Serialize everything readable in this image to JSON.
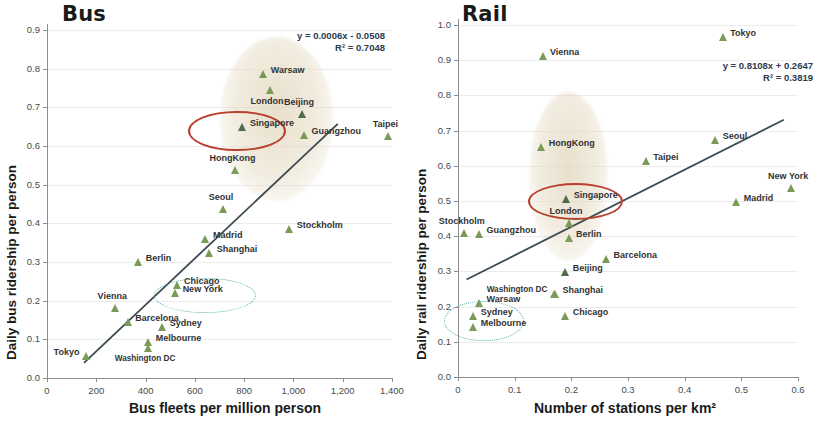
{
  "chart_data": [
    {
      "type": "scatter",
      "title": "Bus",
      "xlabel": "Bus fleets per million person",
      "ylabel": "Daily bus ridership per person",
      "xlim": [
        0,
        1400
      ],
      "ylim": [
        0,
        0.9
      ],
      "xticks": [
        "0",
        "200",
        "400",
        "600",
        "800",
        "1,000",
        "1,200",
        "1,400"
      ],
      "xtick_values": [
        0,
        200,
        400,
        600,
        800,
        1000,
        1200,
        1400
      ],
      "yticks": [
        "0.0",
        "0.1",
        "0.2",
        "0.3",
        "0.4",
        "0.5",
        "0.6",
        "0.7",
        "0.8",
        "0.9"
      ],
      "ytick_values": [
        0.0,
        0.1,
        0.2,
        0.3,
        0.4,
        0.5,
        0.6,
        0.7,
        0.8,
        0.9
      ],
      "grid": true,
      "legend": "none",
      "equation": "y = 0.0006x - 0.0508",
      "r2": "R² = 0.7048",
      "trendline": {
        "slope": 0.0006,
        "intercept": -0.0508,
        "x_start": 150,
        "x_end": 1180
      },
      "points": [
        {
          "label": "Warsaw",
          "x": 880,
          "y": 0.785,
          "label_pos": "right"
        },
        {
          "label": "London",
          "x": 905,
          "y": 0.745,
          "label_pos": "below"
        },
        {
          "label": "Beijing",
          "x": 1035,
          "y": 0.682,
          "label_pos": "above"
        },
        {
          "label": "Singapore",
          "x": 795,
          "y": 0.65,
          "label_pos": "right",
          "highlight": "red"
        },
        {
          "label": "Taipei",
          "x": 1385,
          "y": 0.627,
          "label_pos": "above"
        },
        {
          "label": "Guangzhou",
          "x": 1045,
          "y": 0.628,
          "label_pos": "right"
        },
        {
          "label": "HongKong",
          "x": 765,
          "y": 0.538,
          "label_pos": "above"
        },
        {
          "label": "Seoul",
          "x": 718,
          "y": 0.437,
          "label_pos": "above"
        },
        {
          "label": "Stockholm",
          "x": 985,
          "y": 0.385,
          "label_pos": "right"
        },
        {
          "label": "Madrid",
          "x": 645,
          "y": 0.36,
          "label_pos": "right"
        },
        {
          "label": "Shanghai",
          "x": 660,
          "y": 0.322,
          "label_pos": "right"
        },
        {
          "label": "Berlin",
          "x": 372,
          "y": 0.3,
          "label_pos": "right"
        },
        {
          "label": "Chicago",
          "x": 528,
          "y": 0.241,
          "label_pos": "right"
        },
        {
          "label": "New York",
          "x": 522,
          "y": 0.219,
          "label_pos": "right"
        },
        {
          "label": "Vienna",
          "x": 277,
          "y": 0.181,
          "label_pos": "above"
        },
        {
          "label": "Barcelona",
          "x": 330,
          "y": 0.145,
          "label_pos": "right"
        },
        {
          "label": "Sydney",
          "x": 470,
          "y": 0.133,
          "label_pos": "right",
          "highlight": "teal"
        },
        {
          "label": "Melbourne",
          "x": 413,
          "y": 0.093,
          "label_pos": "right",
          "highlight": "teal"
        },
        {
          "label": "Washington DC",
          "x": 410,
          "y": 0.078,
          "label_pos": "below"
        },
        {
          "label": "Tokyo",
          "x": 160,
          "y": 0.057,
          "label_pos": "left"
        }
      ]
    },
    {
      "type": "scatter",
      "title": "Rail",
      "xlabel": "Number of stations per km²",
      "ylabel": "Daily rail ridership per person",
      "xlim": [
        0,
        0.6
      ],
      "ylim": [
        0,
        1.0
      ],
      "xticks": [
        "0",
        "0.1",
        "0.2",
        "0.3",
        "0.4",
        "0.5",
        "0.6"
      ],
      "xtick_values": [
        0,
        0.1,
        0.2,
        0.3,
        0.4,
        0.5,
        0.6
      ],
      "yticks": [
        "0.0",
        "0.1",
        "0.2",
        "0.3",
        "0.4",
        "0.5",
        "0.6",
        "0.7",
        "0.8",
        "0.9",
        "1.0"
      ],
      "ytick_values": [
        0.0,
        0.1,
        0.2,
        0.3,
        0.4,
        0.5,
        0.6,
        0.7,
        0.8,
        0.9,
        1.0
      ],
      "grid": true,
      "legend": "none",
      "equation": "y = 0.8108x + 0.2647",
      "r2": "R² = 0.3819",
      "trendline": {
        "slope": 0.8108,
        "intercept": 0.2647,
        "x_start": 0.015,
        "x_end": 0.575
      },
      "points": [
        {
          "label": "Tokyo",
          "x": 0.468,
          "y": 0.965,
          "label_pos": "right"
        },
        {
          "label": "Vienna",
          "x": 0.15,
          "y": 0.913,
          "label_pos": "right"
        },
        {
          "label": "Seoul",
          "x": 0.455,
          "y": 0.672,
          "label_pos": "right"
        },
        {
          "label": "HongKong",
          "x": 0.148,
          "y": 0.652,
          "label_pos": "right"
        },
        {
          "label": "Taipei",
          "x": 0.332,
          "y": 0.613,
          "label_pos": "right"
        },
        {
          "label": "New York",
          "x": 0.588,
          "y": 0.538,
          "label_pos": "above"
        },
        {
          "label": "Singapore",
          "x": 0.192,
          "y": 0.505,
          "label_pos": "right",
          "highlight": "red"
        },
        {
          "label": "Madrid",
          "x": 0.492,
          "y": 0.498,
          "label_pos": "right"
        },
        {
          "label": "London",
          "x": 0.196,
          "y": 0.437,
          "label_pos": "above"
        },
        {
          "label": "Stockholm",
          "x": 0.012,
          "y": 0.408,
          "label_pos": "above"
        },
        {
          "label": "Guangzhou",
          "x": 0.038,
          "y": 0.406,
          "label_pos": "right"
        },
        {
          "label": "Berlin",
          "x": 0.196,
          "y": 0.396,
          "label_pos": "right"
        },
        {
          "label": "Barcelona",
          "x": 0.262,
          "y": 0.334,
          "label_pos": "right"
        },
        {
          "label": "Beijing",
          "x": 0.19,
          "y": 0.299,
          "label_pos": "right"
        },
        {
          "label": "Shanghai",
          "x": 0.172,
          "y": 0.237,
          "label_pos": "right"
        },
        {
          "label": "Washington DC",
          "x": 0.17,
          "y": 0.237,
          "label_pos": "left"
        },
        {
          "label": "Warsaw",
          "x": 0.038,
          "y": 0.21,
          "label_pos": "right"
        },
        {
          "label": "Chicago",
          "x": 0.19,
          "y": 0.172,
          "label_pos": "right"
        },
        {
          "label": "Sydney",
          "x": 0.028,
          "y": 0.173,
          "label_pos": "right",
          "highlight": "teal"
        },
        {
          "label": "Melbourne",
          "x": 0.028,
          "y": 0.141,
          "label_pos": "right",
          "highlight": "teal"
        }
      ]
    }
  ],
  "bus": {
    "title": "Bus",
    "xlabel": "Bus fleets per million person",
    "ylabel": "Daily bus ridership per person",
    "equation": "y = 0.0006x - 0.0508",
    "r2": "R² = 0.7048"
  },
  "rail": {
    "title": "Rail",
    "xlabel": "Number of stations per km²",
    "ylabel": "Daily rail ridership per person",
    "equation": "y = 0.8108x + 0.2647",
    "r2": "R² = 0.3819"
  },
  "colors": {
    "marker": "#7a9a58",
    "marker_dark": "#4c6b46",
    "trendline": "#3c4a52",
    "highlight_red": "#b8402f",
    "highlight_teal": "#53b0a8",
    "blob": "#e0d4b8",
    "axis": "#8d8d8d",
    "equation_text": "#2a3b52"
  }
}
